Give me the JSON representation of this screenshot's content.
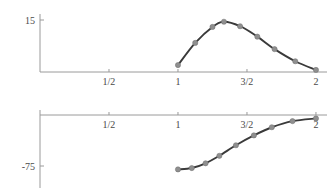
{
  "figure": {
    "title": "",
    "panel_count": 2
  },
  "chart_data": [
    {
      "type": "line",
      "panel": "top",
      "title": "",
      "xlabel": "",
      "ylabel": "",
      "xlim": [
        0,
        2.08
      ],
      "ylim": [
        -1.2,
        16.5
      ],
      "grid": false,
      "legend": "none",
      "x_ticks": [
        0.5,
        1,
        1.5,
        2
      ],
      "x_tick_labels": [
        "1/2",
        "1",
        "3/2",
        "2"
      ],
      "y_ticks": [
        15
      ],
      "y_tick_labels": [
        "15"
      ],
      "marker_color": "#8f8f8f",
      "line_color": "#3a3a3a",
      "axis_color": "#9a9a9a",
      "series": [
        {
          "name": "curve-top",
          "x": [
            1.0,
            1.125,
            1.25,
            1.333,
            1.45,
            1.575,
            1.7,
            1.85,
            2.0
          ],
          "y": [
            2.0,
            8.4,
            13.0,
            14.5,
            13.2,
            10.2,
            6.6,
            3.1,
            0.6
          ]
        }
      ]
    },
    {
      "type": "line",
      "panel": "bottom",
      "title": "",
      "xlabel": "",
      "ylabel": "",
      "xlim": [
        0,
        2.08
      ],
      "ylim": [
        -88,
        6
      ],
      "grid": false,
      "legend": "none",
      "x_ticks": [
        0.5,
        1,
        1.5,
        2
      ],
      "x_tick_labels": [
        "1/2",
        "1",
        "3/2",
        "2"
      ],
      "y_ticks": [
        -75
      ],
      "y_tick_labels": [
        "-75"
      ],
      "marker_color": "#8f8f8f",
      "line_color": "#3a3a3a",
      "axis_color": "#9a9a9a",
      "series": [
        {
          "name": "curve-bottom",
          "x": [
            1.0,
            1.1,
            1.2,
            1.3,
            1.42,
            1.55,
            1.68,
            1.83,
            2.0
          ],
          "y": [
            -80.0,
            -78.0,
            -71.0,
            -60.0,
            -44.5,
            -30.0,
            -18.0,
            -9.0,
            -5.0
          ]
        }
      ]
    }
  ]
}
